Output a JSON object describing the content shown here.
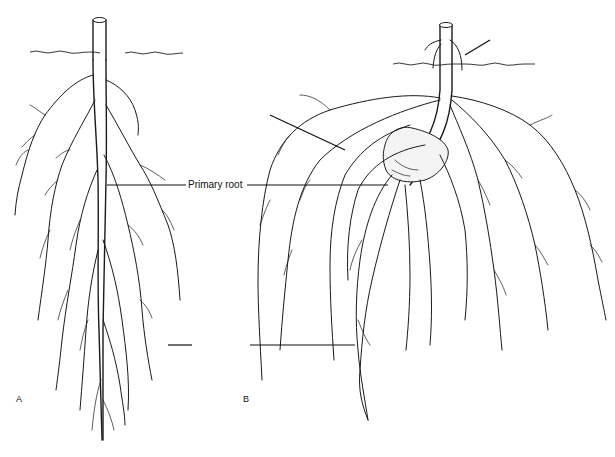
{
  "figure": {
    "panels": [
      {
        "letter": "A",
        "description": "taproot system"
      },
      {
        "letter": "B",
        "description": "fibrous root system"
      }
    ],
    "labels": {
      "primary_root": "Primary root"
    },
    "unlabeled_leaders": [
      {
        "panel": "B",
        "target": "adventitious roots above soil"
      },
      {
        "panel": "B",
        "target": "seminal root"
      },
      {
        "panel": "A",
        "target": "lateral root"
      },
      {
        "panel": "B",
        "target": "lateral root"
      }
    ],
    "colors": {
      "ink": "#1a1a1a",
      "background": "#ffffff"
    }
  }
}
